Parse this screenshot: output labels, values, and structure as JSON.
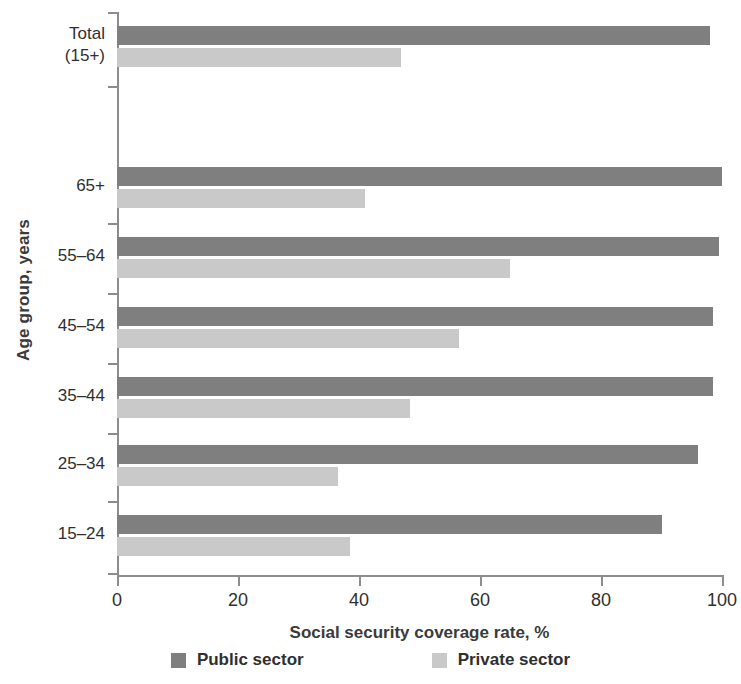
{
  "chart_data": {
    "type": "bar",
    "orientation": "horizontal",
    "title": "",
    "xlabel": "Social security coverage rate, %",
    "ylabel": "Age group, years",
    "xlim": [
      0,
      100
    ],
    "xticks": [
      0,
      20,
      40,
      60,
      80,
      100
    ],
    "grid": false,
    "legend_position": "bottom",
    "categories": [
      "Total\n(15+)",
      "65+",
      "55–64",
      "45–54",
      "35–44",
      "25–34",
      "15–24"
    ],
    "series": [
      {
        "name": "Public sector",
        "color": "#7f7f7f",
        "values": [
          98,
          100,
          99.5,
          98.5,
          98.5,
          96,
          90
        ]
      },
      {
        "name": "Private sector",
        "color": "#c9c9c9",
        "values": [
          47,
          41,
          65,
          56.5,
          48.5,
          36.5,
          38.5
        ]
      }
    ]
  },
  "axes": {
    "x_title": "Social security coverage rate, %",
    "y_title": "Age group, years",
    "x_tick_labels": [
      "0",
      "20",
      "40",
      "60",
      "80",
      "100"
    ],
    "y_tick_labels": [
      "Total\n(15+)",
      "65+",
      "55–64",
      "45–54",
      "35–44",
      "25–34",
      "15–24"
    ]
  },
  "legend": {
    "items": [
      {
        "label": "Public sector",
        "color": "#7f7f7f"
      },
      {
        "label": "Private sector",
        "color": "#c9c9c9"
      }
    ]
  }
}
